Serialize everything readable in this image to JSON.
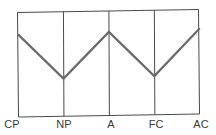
{
  "chart_data": {
    "type": "line",
    "title": "",
    "xlabel": "",
    "ylabel": "",
    "categories": [
      "CP",
      "NP",
      "A",
      "FC",
      "AC"
    ],
    "series": [
      {
        "name": "profile",
        "values": [
          79,
          36,
          80,
          37,
          82
        ]
      }
    ],
    "ylim": [
      0,
      100
    ],
    "grid": {
      "vertical": true,
      "horizontal": false
    },
    "legend": null,
    "colors": {
      "line": "#6b6b6b",
      "frame": "#4a4a4a",
      "background": "#ffffff"
    }
  },
  "axis": {
    "tick_labels": [
      "CP",
      "NP",
      "A",
      "FC",
      "AC"
    ]
  }
}
